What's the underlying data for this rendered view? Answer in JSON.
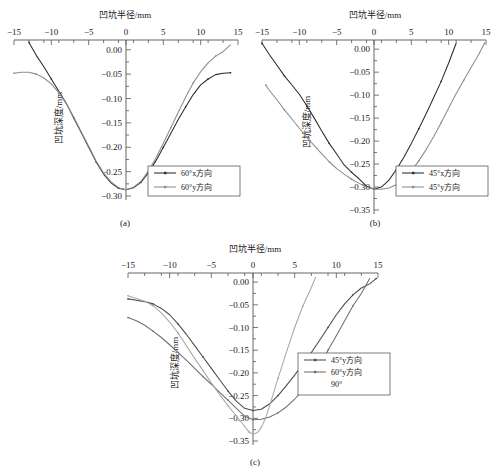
{
  "figure": {
    "axis_title_x": "凹坑半径/mm",
    "axis_title_y": "凹坑深度/mm"
  },
  "panels": [
    {
      "id": "a",
      "caption": "(a)",
      "legend": [
        {
          "label": "60°x方向",
          "color": "#2b2b2b"
        },
        {
          "label": "60°y方向",
          "color": "#8c8c8c"
        }
      ]
    },
    {
      "id": "b",
      "caption": "(b)",
      "legend": [
        {
          "label": "45°x方向",
          "color": "#2b2b2b"
        },
        {
          "label": "45°y方向",
          "color": "#8c8c8c"
        }
      ]
    },
    {
      "id": "c",
      "caption": "(c)",
      "legend": [
        {
          "label": "45°y方向",
          "color": "#4a4a4a"
        },
        {
          "label": "60°y方向",
          "color": "#6f6f6f"
        },
        {
          "label": "90°",
          "color": "#a8a8a8"
        }
      ]
    }
  ],
  "chart_data": [
    {
      "type": "line",
      "panel": "a",
      "title": "(a)",
      "xlabel": "凹坑半径/mm",
      "ylabel": "凹坑深度/mm",
      "xlim": [
        -15,
        15
      ],
      "ylim": [
        -0.3,
        0.02
      ],
      "xticks": [
        -15,
        -10,
        -5,
        0,
        5,
        10,
        15
      ],
      "yticks": [
        0.0,
        -0.05,
        -0.1,
        -0.15,
        -0.2,
        -0.25,
        -0.3
      ],
      "grid": false,
      "legend_position": "lower-right",
      "series": [
        {
          "name": "60°x方向",
          "color": "#2b2b2b",
          "x": [
            -13.0,
            -12.0,
            -11.0,
            -10.0,
            -9.0,
            -8.0,
            -7.0,
            -6.0,
            -5.0,
            -4.0,
            -3.0,
            -2.0,
            -1.0,
            0.0,
            1.0,
            2.0,
            3.0,
            4.0,
            5.0,
            6.0,
            7.0,
            8.0,
            9.0,
            10.0,
            11.0,
            12.0,
            13.0,
            14.0
          ],
          "y": [
            0.015,
            -0.012,
            -0.035,
            -0.06,
            -0.085,
            -0.11,
            -0.14,
            -0.17,
            -0.2,
            -0.23,
            -0.255,
            -0.273,
            -0.284,
            -0.287,
            -0.283,
            -0.272,
            -0.252,
            -0.228,
            -0.2,
            -0.172,
            -0.143,
            -0.117,
            -0.092,
            -0.072,
            -0.06,
            -0.051,
            -0.048,
            -0.047
          ]
        },
        {
          "name": "60°y方向",
          "color": "#8c8c8c",
          "x": [
            -15.0,
            -14.0,
            -13.0,
            -12.0,
            -11.0,
            -10.0,
            -9.0,
            -8.0,
            -7.0,
            -6.0,
            -5.0,
            -4.0,
            -3.0,
            -2.0,
            -1.0,
            0.0,
            1.0,
            2.0,
            3.0,
            4.0,
            5.0,
            6.0,
            7.0,
            8.0,
            9.0,
            10.0,
            11.0,
            12.0,
            13.0,
            14.0
          ],
          "y": [
            -0.048,
            -0.046,
            -0.046,
            -0.05,
            -0.058,
            -0.07,
            -0.088,
            -0.11,
            -0.138,
            -0.168,
            -0.198,
            -0.228,
            -0.253,
            -0.271,
            -0.283,
            -0.287,
            -0.282,
            -0.27,
            -0.249,
            -0.222,
            -0.192,
            -0.16,
            -0.128,
            -0.097,
            -0.068,
            -0.045,
            -0.027,
            -0.013,
            -0.004,
            0.01
          ]
        }
      ]
    },
    {
      "type": "line",
      "panel": "b",
      "title": "(b)",
      "xlabel": "凹坑半径/mm",
      "ylabel": "凹坑深度/mm",
      "xlim": [
        -15,
        15
      ],
      "ylim": [
        -0.35,
        0.02
      ],
      "xticks": [
        -15,
        -10,
        -5,
        0,
        5,
        10,
        15
      ],
      "yticks": [
        0.0,
        -0.05,
        -0.1,
        -0.15,
        -0.2,
        -0.25,
        -0.3,
        -0.35
      ],
      "grid": false,
      "legend_position": "lower-right",
      "series": [
        {
          "name": "45°x方向",
          "color": "#2b2b2b",
          "x": [
            -15.0,
            -14.0,
            -13.0,
            -12.0,
            -11.0,
            -10.0,
            -9.0,
            -8.0,
            -7.0,
            -6.0,
            -5.0,
            -4.0,
            -3.0,
            -2.0,
            -1.0,
            0.0,
            1.0,
            2.0,
            3.0,
            4.0,
            5.0,
            6.0,
            7.0,
            8.0,
            9.0,
            10.0,
            11.0
          ],
          "y": [
            0.013,
            -0.012,
            -0.035,
            -0.058,
            -0.078,
            -0.098,
            -0.123,
            -0.15,
            -0.178,
            -0.205,
            -0.228,
            -0.252,
            -0.268,
            -0.282,
            -0.298,
            -0.305,
            -0.3,
            -0.285,
            -0.262,
            -0.235,
            -0.205,
            -0.173,
            -0.14,
            -0.105,
            -0.07,
            -0.03,
            0.013
          ]
        },
        {
          "name": "45°y方向",
          "color": "#8c8c8c",
          "x": [
            -14.5,
            -14.0,
            -13.0,
            -12.0,
            -11.0,
            -10.0,
            -9.0,
            -8.0,
            -7.0,
            -6.0,
            -5.0,
            -4.0,
            -3.0,
            -2.0,
            -1.0,
            0.0,
            1.0,
            2.0,
            3.0,
            4.0,
            5.0,
            6.0,
            7.0,
            8.0,
            9.0,
            10.0,
            11.0,
            12.0,
            13.0,
            14.0,
            14.8
          ],
          "y": [
            -0.078,
            -0.09,
            -0.11,
            -0.132,
            -0.152,
            -0.172,
            -0.192,
            -0.21,
            -0.228,
            -0.245,
            -0.26,
            -0.272,
            -0.283,
            -0.292,
            -0.3,
            -0.305,
            -0.305,
            -0.302,
            -0.295,
            -0.283,
            -0.265,
            -0.243,
            -0.218,
            -0.19,
            -0.16,
            -0.128,
            -0.097,
            -0.068,
            -0.04,
            -0.012,
            0.013
          ]
        }
      ]
    },
    {
      "type": "line",
      "panel": "c",
      "title": "(c)",
      "xlabel": "凹坑半径/mm",
      "ylabel": "凹坑深度/mm",
      "xlim": [
        -15,
        15
      ],
      "ylim": [
        -0.35,
        0.02
      ],
      "xticks": [
        -15,
        -10,
        -5,
        0,
        5,
        10,
        15
      ],
      "yticks": [
        0.0,
        -0.05,
        -0.1,
        -0.15,
        -0.2,
        -0.25,
        -0.3,
        -0.35
      ],
      "grid": false,
      "legend_position": "middle-right",
      "series": [
        {
          "name": "45°y方向",
          "color": "#4a4a4a",
          "x": [
            -15.0,
            -14.0,
            -13.0,
            -12.0,
            -11.0,
            -10.0,
            -9.0,
            -8.0,
            -7.0,
            -6.0,
            -5.0,
            -4.0,
            -3.0,
            -2.0,
            -1.0,
            0.0,
            1.0,
            2.0,
            3.0,
            4.0,
            5.0,
            6.0,
            7.0,
            8.0,
            9.0,
            10.0,
            11.0,
            12.0,
            13.0,
            14.0,
            14.8
          ],
          "y": [
            -0.037,
            -0.04,
            -0.043,
            -0.048,
            -0.058,
            -0.072,
            -0.092,
            -0.115,
            -0.14,
            -0.165,
            -0.19,
            -0.215,
            -0.24,
            -0.262,
            -0.278,
            -0.283,
            -0.28,
            -0.268,
            -0.25,
            -0.228,
            -0.205,
            -0.18,
            -0.155,
            -0.128,
            -0.1,
            -0.072,
            -0.048,
            -0.028,
            -0.013,
            -0.004,
            0.008
          ]
        },
        {
          "name": "60°y方向",
          "color": "#6f6f6f",
          "x": [
            -15.0,
            -14.0,
            -13.0,
            -12.0,
            -11.0,
            -10.0,
            -9.0,
            -8.0,
            -7.0,
            -6.0,
            -5.0,
            -4.0,
            -3.0,
            -2.0,
            -1.0,
            0.0,
            1.0,
            2.0,
            3.0,
            4.0,
            5.0,
            6.0,
            7.0,
            8.0,
            9.0,
            10.0,
            11.0,
            12.0,
            13.0,
            14.0
          ],
          "y": [
            -0.078,
            -0.085,
            -0.095,
            -0.108,
            -0.122,
            -0.138,
            -0.155,
            -0.172,
            -0.19,
            -0.208,
            -0.225,
            -0.243,
            -0.26,
            -0.278,
            -0.295,
            -0.303,
            -0.302,
            -0.297,
            -0.288,
            -0.275,
            -0.258,
            -0.237,
            -0.212,
            -0.182,
            -0.15,
            -0.118,
            -0.085,
            -0.052,
            -0.025,
            0.008
          ]
        },
        {
          "name": "90°",
          "color": "#a8a8a8",
          "x": [
            -15.0,
            -14.0,
            -13.0,
            -12.0,
            -11.0,
            -10.0,
            -9.0,
            -8.0,
            -7.0,
            -6.0,
            -5.0,
            -4.0,
            -3.0,
            -2.0,
            -1.0,
            -0.5,
            0.0,
            0.5,
            1.0,
            1.5,
            2.0,
            3.0,
            4.0,
            5.0,
            6.0,
            7.0,
            7.5
          ],
          "y": [
            -0.03,
            -0.036,
            -0.042,
            -0.052,
            -0.068,
            -0.088,
            -0.112,
            -0.14,
            -0.168,
            -0.195,
            -0.222,
            -0.248,
            -0.272,
            -0.295,
            -0.318,
            -0.33,
            -0.335,
            -0.332,
            -0.32,
            -0.3,
            -0.272,
            -0.212,
            -0.155,
            -0.1,
            -0.052,
            -0.012,
            0.01
          ]
        }
      ]
    }
  ]
}
